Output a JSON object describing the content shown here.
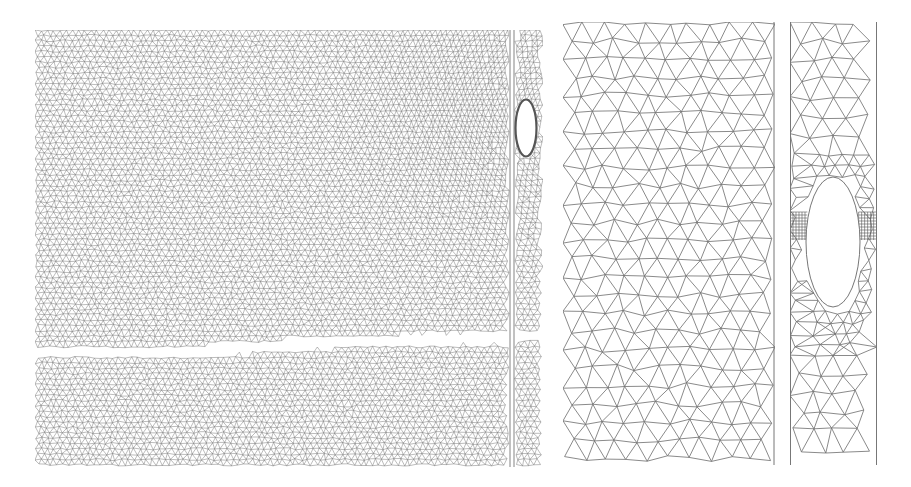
{
  "figure": {
    "description": "Finite element triangular meshes: full domain with crack and slit, and zoomed views near the slit and elliptical hole",
    "background": "#ffffff",
    "line_color": "#6e6e6e",
    "panels": [
      {
        "id": "full-domain-mesh",
        "label": "Full domain mesh",
        "box": [
          35,
          30,
          508,
          437
        ],
        "spacing": 6.2,
        "dense_region": {
          "cx": 470,
          "cy": 110,
          "r": 160,
          "min_spacing": 4.2
        },
        "crack": {
          "points": [
            [
              35,
              353
            ],
            [
              200,
              351
            ],
            [
              300,
              344
            ],
            [
              420,
              340
            ],
            [
              543,
              336
            ]
          ],
          "width": 7
        },
        "slit": {
          "x1": 510,
          "x2": 514,
          "y1": 30,
          "y2": 467
        },
        "hole": {
          "cx": 526,
          "cy": 128,
          "rx": 9,
          "ry": 27
        }
      },
      {
        "id": "zoom-left-mesh",
        "label": "Zoomed mesh left of slit",
        "box": [
          563,
          22,
          212,
          443
        ],
        "spacing": 21,
        "right_edge_line": true
      },
      {
        "id": "zoom-hole-mesh",
        "label": "Zoomed mesh around elliptical hole",
        "box": [
          790,
          22,
          87,
          443
        ],
        "spacing": 22,
        "hole": {
          "cx": 833,
          "cy": 242,
          "rx": 27,
          "ry": 65
        },
        "refined_grid": {
          "y1": 212,
          "y2": 240,
          "cell": 3
        }
      }
    ]
  }
}
